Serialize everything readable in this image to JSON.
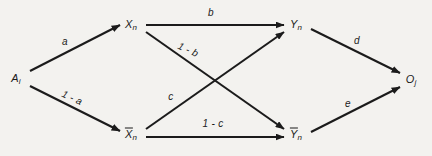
{
  "figure": {
    "kind": "directed-graph-diagram",
    "background_color": "#f3f2ef",
    "stroke_color": "#1b1b1b",
    "width": 432,
    "height": 156
  },
  "nodes": {
    "source": {
      "base": "A",
      "subscript": "i",
      "overbar": false,
      "x": 16,
      "y": 78
    },
    "x": {
      "base": "X",
      "subscript": "n",
      "overbar": false,
      "x": 131,
      "y": 24
    },
    "x_bar": {
      "base": "X",
      "subscript": "n",
      "overbar": true,
      "x": 131,
      "y": 134
    },
    "y": {
      "base": "Y",
      "subscript": "n",
      "overbar": false,
      "x": 296,
      "y": 24
    },
    "y_bar": {
      "base": "Y",
      "subscript": "n",
      "overbar": true,
      "x": 296,
      "y": 134
    },
    "sink": {
      "base": "O",
      "subscript": "j",
      "overbar": false,
      "x": 411,
      "y": 79
    }
  },
  "edges": [
    {
      "id": "a",
      "label": "a",
      "from": "source",
      "to": "x",
      "label_x": 65,
      "label_y": 42,
      "rotation": 0
    },
    {
      "id": "1-a",
      "label": "1 - a",
      "from": "source",
      "to": "x_bar",
      "label_x": 72,
      "label_y": 98,
      "rotation": 25
    },
    {
      "id": "b",
      "label": "b",
      "from": "x",
      "to": "y",
      "label_x": 211,
      "label_y": 13,
      "rotation": 0
    },
    {
      "id": "1-b",
      "label": "1 - b",
      "from": "x",
      "to": "y_bar",
      "label_x": 188,
      "label_y": 50,
      "rotation": 25
    },
    {
      "id": "c",
      "label": "c",
      "from": "x_bar",
      "to": "y",
      "label_x": 171,
      "label_y": 97,
      "rotation": 0
    },
    {
      "id": "1-c",
      "label": "1 - c",
      "from": "x_bar",
      "to": "y_bar",
      "label_x": 213,
      "label_y": 124,
      "rotation": 0
    },
    {
      "id": "d",
      "label": "d",
      "from": "y",
      "to": "sink",
      "label_x": 357,
      "label_y": 41,
      "rotation": 0
    },
    {
      "id": "e",
      "label": "e",
      "from": "y_bar",
      "to": "sink",
      "label_x": 348,
      "label_y": 104,
      "rotation": 0
    }
  ],
  "geometry": {
    "lines": [
      {
        "id": "line-a",
        "x1": 30,
        "y1": 71,
        "x2": 120,
        "y2": 25
      },
      {
        "id": "line-1-a",
        "x1": 30,
        "y1": 86,
        "x2": 120,
        "y2": 131
      },
      {
        "id": "line-b",
        "x1": 146,
        "y1": 25,
        "x2": 284,
        "y2": 25
      },
      {
        "id": "line-1-b",
        "x1": 146,
        "y1": 32,
        "x2": 284,
        "y2": 129
      },
      {
        "id": "line-c",
        "x1": 146,
        "y1": 129,
        "x2": 284,
        "y2": 32
      },
      {
        "id": "line-1-c",
        "x1": 146,
        "y1": 137,
        "x2": 284,
        "y2": 137
      },
      {
        "id": "line-d",
        "x1": 311,
        "y1": 29,
        "x2": 400,
        "y2": 73
      },
      {
        "id": "line-e",
        "x1": 311,
        "y1": 132,
        "x2": 400,
        "y2": 87
      }
    ]
  }
}
